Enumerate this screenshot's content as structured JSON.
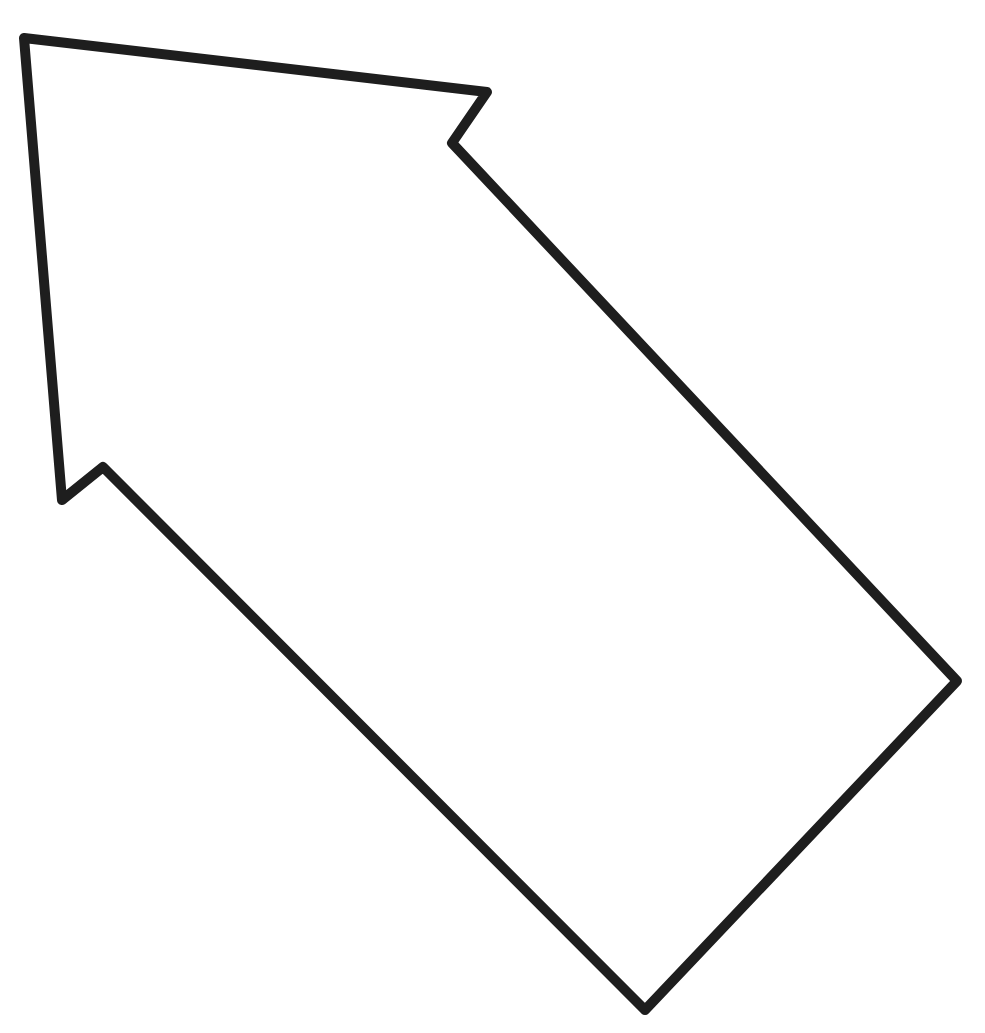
{
  "diagram": {
    "shape": "arrow-outline",
    "direction": "up-left",
    "label": "",
    "stroke_color": "#1e1e1e",
    "fill_color": "#ffffff",
    "background_color": "#ffffff",
    "stroke_width": 10,
    "vertices": [
      {
        "name": "tip",
        "x": 24,
        "y": 38
      },
      {
        "name": "head-right-outer",
        "x": 487,
        "y": 92
      },
      {
        "name": "head-right-inner",
        "x": 452,
        "y": 143
      },
      {
        "name": "shaft-right-end",
        "x": 957,
        "y": 681
      },
      {
        "name": "shaft-bottom-end",
        "x": 645,
        "y": 1010
      },
      {
        "name": "head-left-inner",
        "x": 103,
        "y": 467
      },
      {
        "name": "head-left-outer",
        "x": 62,
        "y": 500
      }
    ],
    "points_attr": "24,38 487,92 452,143 957,681 645,1010 103,467 62,500"
  }
}
